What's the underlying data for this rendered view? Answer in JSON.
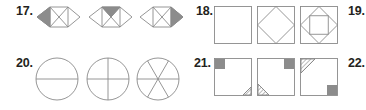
{
  "problems": [
    {
      "number": "17.",
      "figures": [
        {
          "type": "hexagon-x",
          "shaded": "left-triangle"
        },
        {
          "type": "hexagon-x",
          "shaded": "top-center-triangle"
        },
        {
          "type": "hexagon-x",
          "shaded": "right-triangle"
        }
      ]
    },
    {
      "number": "18.",
      "figures": [
        {
          "type": "square",
          "inner": "none"
        },
        {
          "type": "square",
          "inner": "inscribed-diamond"
        },
        {
          "type": "square",
          "inner": "inscribed-diamond-with-square"
        }
      ]
    },
    {
      "number": "19.",
      "figures": []
    },
    {
      "number": "20.",
      "figures": [
        {
          "type": "circle",
          "divisions": 2
        },
        {
          "type": "circle",
          "divisions": 4
        },
        {
          "type": "circle",
          "divisions": 6
        }
      ]
    },
    {
      "number": "21.",
      "figures": [
        {
          "type": "square",
          "shaded_corner": "top-left",
          "hatched_corner": "bottom-right"
        },
        {
          "type": "square",
          "shaded_corner": "top-right",
          "hatched_corner": "bottom-left"
        },
        {
          "type": "square",
          "shaded_corner": "bottom-right",
          "hatched_corner": "top-left"
        }
      ]
    },
    {
      "number": "22.",
      "figures": []
    }
  ],
  "colors": {
    "line": "#8a8a8a",
    "shade": "#8c8c8c",
    "text": "#231f20"
  }
}
